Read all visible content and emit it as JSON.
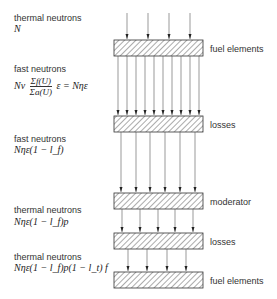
{
  "left_labels": [
    {
      "title": "thermal neutrons",
      "formula": "N"
    },
    {
      "title": "fast neutrons",
      "formula_prefix": "Nν",
      "fraction_num": "Σf(U)",
      "fraction_den": "Σa(U)",
      "formula_suffix": "ε = Nηε"
    },
    {
      "title": "fast neutrons",
      "formula": "Nηε(1 − l_f)"
    },
    {
      "title": "thermal neutrons",
      "formula": "Nηε(1 − l_f)p"
    },
    {
      "title": "thermal neutrons",
      "formula": "Nηε(1 − l_f)p(1 − l_t) f"
    }
  ],
  "boxes": [
    {
      "label": "fuel elements",
      "arrows_in": 4
    },
    {
      "label": "losses",
      "arrows_in": 10
    },
    {
      "label": "moderator",
      "arrows_in": 6
    },
    {
      "label": "losses",
      "arrows_in": 5
    },
    {
      "label": "fuel elements",
      "arrows_in": 4
    }
  ]
}
